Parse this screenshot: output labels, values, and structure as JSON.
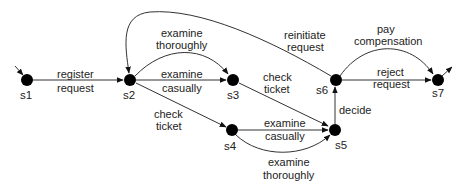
{
  "diagram": {
    "type": "state-transition-system",
    "states": [
      {
        "id": "s1",
        "label": "s1",
        "x": 27,
        "y": 80,
        "initial": true
      },
      {
        "id": "s2",
        "label": "s2",
        "x": 130,
        "y": 80
      },
      {
        "id": "s3",
        "label": "s3",
        "x": 233,
        "y": 80
      },
      {
        "id": "s4",
        "label": "s4",
        "x": 232,
        "y": 130
      },
      {
        "id": "s5",
        "label": "s5",
        "x": 335,
        "y": 130
      },
      {
        "id": "s6",
        "label": "s6",
        "x": 336,
        "y": 80
      },
      {
        "id": "s7",
        "label": "s7",
        "x": 438,
        "y": 80,
        "final": true
      }
    ],
    "transitions": [
      {
        "from": "s1",
        "to": "s2",
        "label_line1": "register",
        "label_line2": "request"
      },
      {
        "from": "s2",
        "to": "s3",
        "label_line1": "examine",
        "label_line2": "thoroughly"
      },
      {
        "from": "s2",
        "to": "s3",
        "label_line1": "examine",
        "label_line2": "casually"
      },
      {
        "from": "s2",
        "to": "s4",
        "label_line1": "check",
        "label_line2": "ticket"
      },
      {
        "from": "s3",
        "to": "s5",
        "label_line1": "check",
        "label_line2": "ticket"
      },
      {
        "from": "s4",
        "to": "s5",
        "label_line1": "examine",
        "label_line2": "casually"
      },
      {
        "from": "s4",
        "to": "s5",
        "label_line1": "examine",
        "label_line2": "thoroughly"
      },
      {
        "from": "s5",
        "to": "s6",
        "label_line1": "decide",
        "label_line2": ""
      },
      {
        "from": "s6",
        "to": "s2",
        "label_line1": "reinitiate",
        "label_line2": "request"
      },
      {
        "from": "s6",
        "to": "s7",
        "label_line1": "pay",
        "label_line2": "compensation"
      },
      {
        "from": "s6",
        "to": "s7",
        "label_line1": "reject",
        "label_line2": "request"
      }
    ]
  }
}
